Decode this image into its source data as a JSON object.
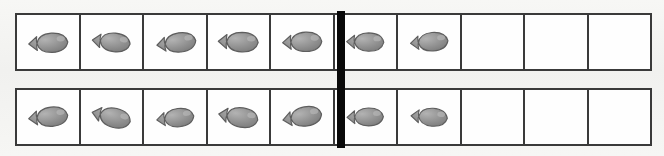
{
  "worksheet": {
    "title": "Ten frame fish counters",
    "background_color": "#f4f4f2",
    "frame_border_color": "#3a3a3a",
    "cell_fill_color": "#fefefe",
    "divider_color": "#090909",
    "counter_color": "#8f8f8f",
    "counter_outline_color": "#5e5e5e",
    "counter_icon_name": "fish-cracker-icon",
    "cells_per_row": 10,
    "group_split_after_cell": 5,
    "rows": [
      {
        "row_label": "top-row",
        "filled_count": 7,
        "empty_count": 3,
        "cells": [
          {
            "index": 1,
            "filled": true,
            "counter": "fish"
          },
          {
            "index": 2,
            "filled": true,
            "counter": "fish"
          },
          {
            "index": 3,
            "filled": true,
            "counter": "fish"
          },
          {
            "index": 4,
            "filled": true,
            "counter": "fish"
          },
          {
            "index": 5,
            "filled": true,
            "counter": "fish"
          },
          {
            "index": 6,
            "filled": true,
            "counter": "fish"
          },
          {
            "index": 7,
            "filled": true,
            "counter": "fish"
          },
          {
            "index": 8,
            "filled": false,
            "counter": ""
          },
          {
            "index": 9,
            "filled": false,
            "counter": ""
          },
          {
            "index": 10,
            "filled": false,
            "counter": ""
          }
        ]
      },
      {
        "row_label": "bottom-row",
        "filled_count": 7,
        "empty_count": 3,
        "cells": [
          {
            "index": 1,
            "filled": true,
            "counter": "fish"
          },
          {
            "index": 2,
            "filled": true,
            "counter": "fish"
          },
          {
            "index": 3,
            "filled": true,
            "counter": "fish"
          },
          {
            "index": 4,
            "filled": true,
            "counter": "fish"
          },
          {
            "index": 5,
            "filled": true,
            "counter": "fish"
          },
          {
            "index": 6,
            "filled": true,
            "counter": "fish"
          },
          {
            "index": 7,
            "filled": true,
            "counter": "fish"
          },
          {
            "index": 8,
            "filled": false,
            "counter": ""
          },
          {
            "index": 9,
            "filled": false,
            "counter": ""
          },
          {
            "index": 10,
            "filled": false,
            "counter": ""
          }
        ]
      }
    ]
  }
}
